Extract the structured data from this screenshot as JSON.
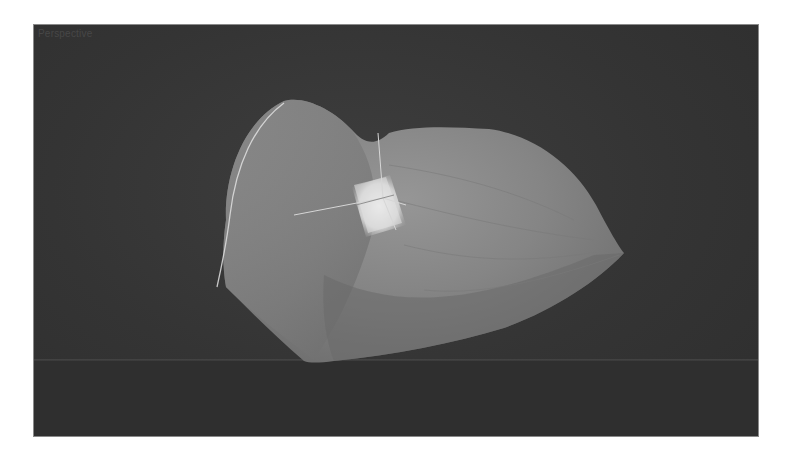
{
  "viewport": {
    "label": "Perspective",
    "background_color": "#363636",
    "object": {
      "type": "nurbs-surface",
      "color": "#8a8a8a",
      "selected_patch_color": "#e6e6e6"
    },
    "gizmo": {
      "type": "transform-axes",
      "color": "#d8d8d8"
    }
  }
}
